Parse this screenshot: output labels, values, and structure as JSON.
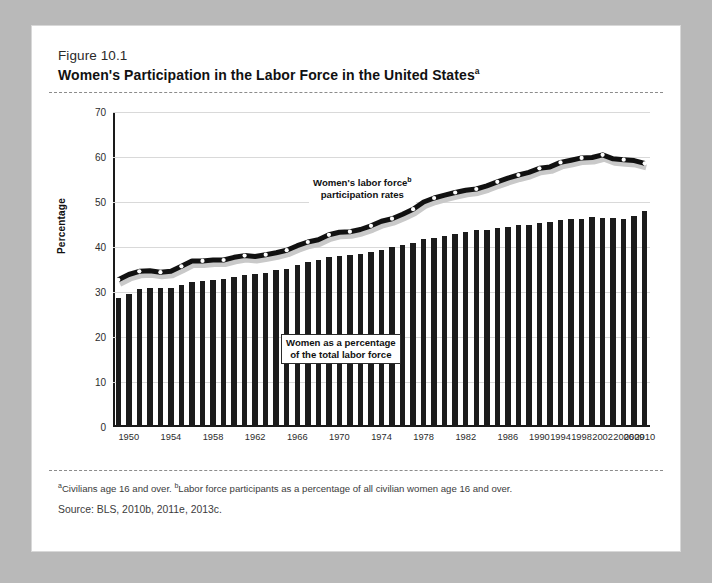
{
  "figure": {
    "number_label": "Figure 10.1",
    "title": "Women's Participation in the Labor Force in the United States",
    "title_superscript": "a",
    "footnote": "Civilians age 16 and over. ",
    "footnote_sup_a": "a",
    "footnote_b_sup": "b",
    "footnote_b": "Labor force participants as a percentage of all civilian women age 16 and over.",
    "source": "Source:  BLS, 2010b, 2011e, 2013c."
  },
  "annotations": {
    "line_label_part1": "Women's labor force",
    "line_label_sup": "b",
    "line_label_part2": "participation rates",
    "bar_label_part1": "Women as a percentage",
    "bar_label_part2": "of the total labor force"
  },
  "chart_data": {
    "type": "bar",
    "title": "Women's Participation in the Labor Force in the United States",
    "xlabel": "",
    "ylabel": "Percentage",
    "ylim": [
      0,
      70
    ],
    "yticks": [
      0,
      10,
      20,
      30,
      40,
      50,
      60,
      70
    ],
    "grid": true,
    "legend_position": "inline-annotation",
    "categories": [
      "1948",
      "1950",
      "1951",
      "1952",
      "1953",
      "1954",
      "1955",
      "1956",
      "1957",
      "1958",
      "1959",
      "1960",
      "1961",
      "1962",
      "1963",
      "1964",
      "1965",
      "1966",
      "1967",
      "1968",
      "1969",
      "1970",
      "1971",
      "1972",
      "1973",
      "1974",
      "1975",
      "1976",
      "1977",
      "1978",
      "1979",
      "1980",
      "1981",
      "1982",
      "1983",
      "1984",
      "1985",
      "1986",
      "1987",
      "1988",
      "1990",
      "1992",
      "1994",
      "1996",
      "1998",
      "2000",
      "2002",
      "2004",
      "2006",
      "2009",
      "2010"
    ],
    "xtick_labels": [
      "1950",
      "1954",
      "1958",
      "1962",
      "1966",
      "1970",
      "1974",
      "1978",
      "1982",
      "1986",
      "1990",
      "1994",
      "1998",
      "2002",
      "2006",
      "2009",
      "2010"
    ],
    "series": [
      {
        "name": "Women as a percentage of the total labor force",
        "render": "bar",
        "color": "#1c1c1c",
        "values": [
          28.6,
          29.6,
          30.6,
          30.8,
          30.8,
          30.9,
          31.6,
          32.2,
          32.5,
          32.7,
          32.8,
          33.4,
          33.8,
          34.0,
          34.3,
          34.8,
          35.2,
          36.0,
          36.6,
          37.1,
          37.8,
          38.1,
          38.2,
          38.5,
          38.9,
          39.4,
          40.0,
          40.5,
          41.0,
          41.7,
          42.0,
          42.5,
          43.0,
          43.4,
          43.7,
          43.8,
          44.2,
          44.4,
          44.8,
          45.0,
          45.3,
          45.5,
          46.0,
          46.2,
          46.3,
          46.6,
          46.5,
          46.4,
          46.3,
          46.8,
          47.9
        ]
      },
      {
        "name": "Women's labor force participation rates",
        "render": "line",
        "color": "#111111",
        "values": [
          32.7,
          33.9,
          34.6,
          34.7,
          34.4,
          34.6,
          35.7,
          36.9,
          36.9,
          37.1,
          37.1,
          37.7,
          38.1,
          37.9,
          38.3,
          38.7,
          39.3,
          40.3,
          41.1,
          41.6,
          42.7,
          43.3,
          43.4,
          43.9,
          44.7,
          45.7,
          46.3,
          47.3,
          48.4,
          50.0,
          50.9,
          51.5,
          52.1,
          52.6,
          52.9,
          53.6,
          54.5,
          55.3,
          56.0,
          56.6,
          57.5,
          57.8,
          58.8,
          59.3,
          59.8,
          59.9,
          60.5,
          59.6,
          59.4,
          59.2,
          58.6
        ]
      }
    ]
  }
}
